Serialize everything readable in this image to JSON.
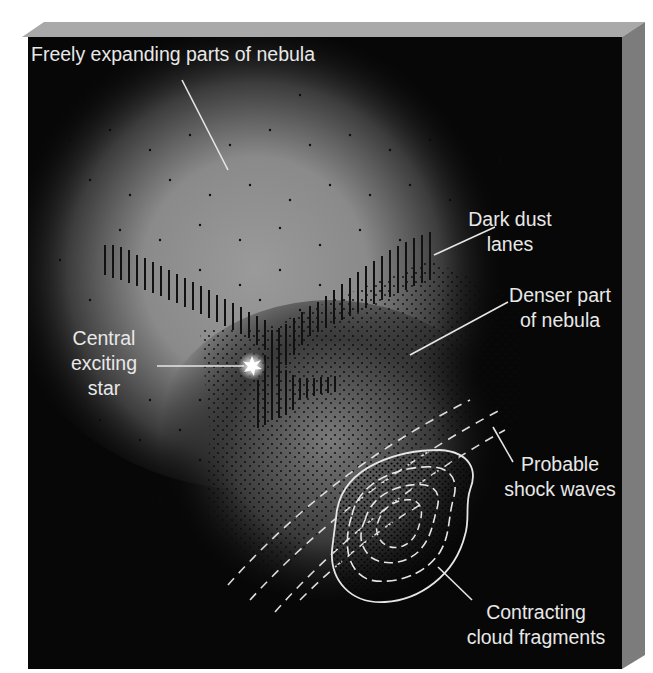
{
  "figure": {
    "colors": {
      "background": "#ffffff",
      "panel_face": "#070707",
      "panel_top": "#a9a9a9",
      "panel_side": "#7c7c7c",
      "nebula_glow": "#8f8f8f",
      "label_text": "#e8e8e8",
      "pointer_line": "#e6e6e6",
      "dust_lane": "#111111",
      "star": "#ffffff"
    },
    "labels": {
      "freely_expanding": [
        "Freely expanding parts of nebula"
      ],
      "dark_dust": [
        "Dark dust",
        "lanes"
      ],
      "denser_part": [
        "Denser part",
        "of nebula"
      ],
      "central_star": [
        "Central",
        "exciting",
        "star"
      ],
      "shock_waves": [
        "Probable",
        "shock waves"
      ],
      "contracting": [
        "Contracting",
        "cloud fragments"
      ]
    },
    "pointers": [
      {
        "name": "freely-expanding-pointer",
        "x1": 182,
        "y1": 80,
        "x2": 228,
        "y2": 170
      },
      {
        "name": "dark-dust-pointer",
        "x1": 434,
        "y1": 255,
        "x2": 495,
        "y2": 227
      },
      {
        "name": "denser-part-pointer",
        "x1": 410,
        "y1": 355,
        "x2": 508,
        "y2": 302
      },
      {
        "name": "central-star-pointer",
        "x1": 157,
        "y1": 366,
        "x2": 245,
        "y2": 366
      },
      {
        "name": "shock-waves-pointer",
        "x1": 493,
        "y1": 427,
        "x2": 513,
        "y2": 462
      },
      {
        "name": "contracting-pointer",
        "x1": 438,
        "y1": 567,
        "x2": 472,
        "y2": 600
      }
    ]
  }
}
